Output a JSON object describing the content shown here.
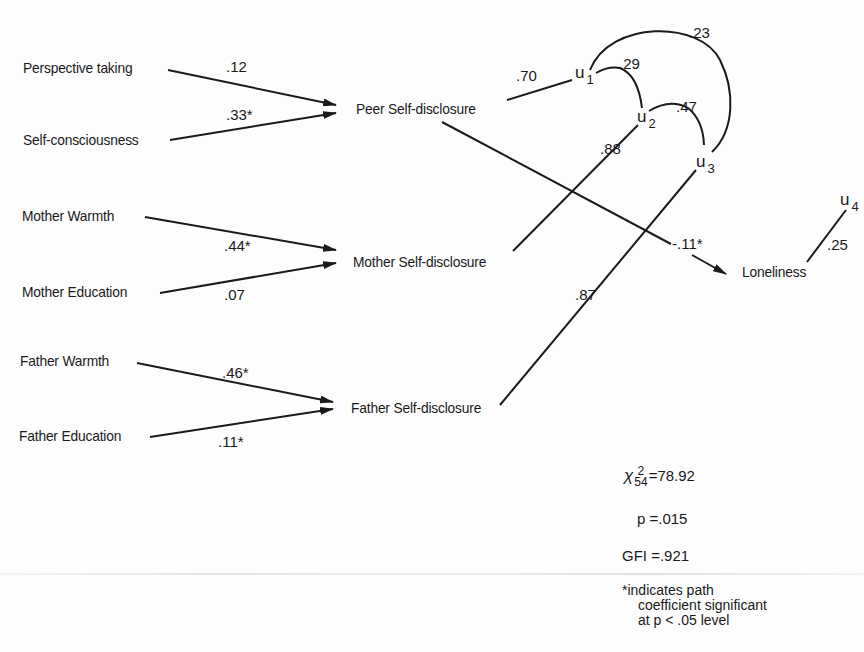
{
  "diagram": {
    "type": "path-model",
    "exogenous": [
      {
        "id": "perspective_taking",
        "label": "Perspective taking"
      },
      {
        "id": "self_consciousness",
        "label": "Self-consciousness"
      },
      {
        "id": "mother_warmth",
        "label": "Mother Warmth"
      },
      {
        "id": "mother_education",
        "label": "Mother Education"
      },
      {
        "id": "father_warmth",
        "label": "Father Warmth"
      },
      {
        "id": "father_education",
        "label": "Father Education"
      }
    ],
    "mediators": [
      {
        "id": "peer_sd",
        "label": "Peer Self-disclosure"
      },
      {
        "id": "mother_sd",
        "label": "Mother Self-disclosure"
      },
      {
        "id": "father_sd",
        "label": "Father Self-disclosure"
      }
    ],
    "outcome": {
      "id": "loneliness",
      "label": "Loneliness"
    },
    "residuals": [
      {
        "id": "u1",
        "base": "u",
        "sub": "1"
      },
      {
        "id": "u2",
        "base": "u",
        "sub": "2"
      },
      {
        "id": "u3",
        "base": "u",
        "sub": "3"
      },
      {
        "id": "u4",
        "base": "u",
        "sub": "4"
      }
    ],
    "paths": [
      {
        "from": "perspective_taking",
        "to": "peer_sd",
        "coef": ".12"
      },
      {
        "from": "self_consciousness",
        "to": "peer_sd",
        "coef": ".33*"
      },
      {
        "from": "mother_warmth",
        "to": "mother_sd",
        "coef": ".44*"
      },
      {
        "from": "mother_education",
        "to": "mother_sd",
        "coef": ".07"
      },
      {
        "from": "father_warmth",
        "to": "father_sd",
        "coef": ".46*"
      },
      {
        "from": "father_education",
        "to": "father_sd",
        "coef": ".11*"
      },
      {
        "from": "peer_sd",
        "to": "loneliness",
        "coef": "-.11*"
      }
    ],
    "residual_paths": [
      {
        "from": "u1",
        "to": "peer_sd",
        "coef": ".70"
      },
      {
        "from": "u2",
        "to": "mother_sd",
        "coef": ".88"
      },
      {
        "from": "u3",
        "to": "father_sd",
        "coef": ".87"
      },
      {
        "from": "u4",
        "to": "loneliness",
        "coef": ".25"
      }
    ],
    "correlations": [
      {
        "a": "u1",
        "b": "u2",
        "coef": ".29"
      },
      {
        "a": "u2",
        "b": "u3",
        "coef": ".47"
      },
      {
        "a": "u1",
        "b": "u3",
        "coef": ".23"
      }
    ]
  },
  "fit": {
    "chi_symbol": "χ",
    "chi_sup": "2",
    "chi_sub": "54",
    "chi_value": "=78.92",
    "p": "p =.015",
    "gfi": "GFI =.921"
  },
  "note": {
    "star": "*",
    "line1": "indicates path",
    "line2": "coefficient significant",
    "line3": "at p < .05 level"
  },
  "colors": {
    "ink": "#1a1a1a",
    "background": "#fdfdfd"
  }
}
